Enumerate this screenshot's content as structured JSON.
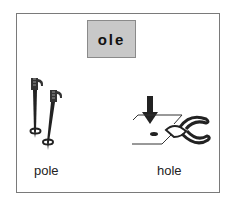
{
  "card": {
    "word_family": "ole",
    "items": [
      {
        "label": "pole",
        "icon": "ski-poles-icon"
      },
      {
        "label": "hole",
        "icon": "hole-punch-icon"
      }
    ]
  },
  "colors": {
    "word_box_bg": "#c8c8c8",
    "border": "#7a7a7a"
  }
}
